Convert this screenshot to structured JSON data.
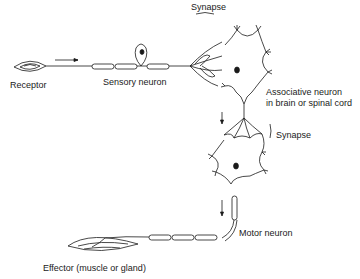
{
  "diagram": {
    "type": "reflex-arc",
    "labels": {
      "receptor": "Receptor",
      "sensory_neuron": "Sensory neuron",
      "synapse_top": "Synapse",
      "associative_neuron_line1": "Associative neuron",
      "associative_neuron_line2": "in brain or spinal cord",
      "synapse_middle": "Synapse",
      "motor_neuron": "Motor neuron",
      "effector": "Effector (muscle or gland)"
    },
    "flow": [
      "Receptor",
      "Sensory neuron",
      "Synapse",
      "Associative neuron",
      "Synapse",
      "Motor neuron",
      "Effector"
    ],
    "colors": {
      "ink": "#1a1a1a",
      "background": "#ffffff"
    }
  }
}
